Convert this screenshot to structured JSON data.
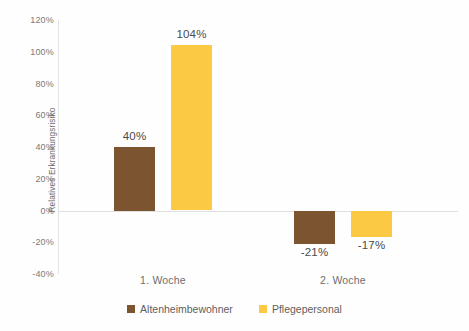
{
  "chart_data": {
    "type": "bar",
    "title": "",
    "xlabel": "",
    "ylabel": "Relatives Erkrankungsrisiko",
    "categories": [
      "1. Woche",
      "2. Woche"
    ],
    "series": [
      {
        "name": "Altenheimbewohner",
        "color": "#7d5430",
        "values": [
          40,
          -21
        ],
        "value_labels": [
          "40%",
          "-21%"
        ]
      },
      {
        "name": "Pflegepersonal",
        "color": "#fbc944",
        "values": [
          104,
          -17
        ],
        "value_labels": [
          "104%",
          "-17%"
        ]
      }
    ],
    "ylim": [
      -40,
      120
    ],
    "ytick_values": [
      120,
      100,
      80,
      60,
      40,
      20,
      0,
      -20,
      -40
    ],
    "ytick_labels": [
      "120%",
      "100%",
      "80%",
      "60%",
      "40%",
      "20%",
      "0%",
      "-20%",
      "-40%"
    ],
    "grid": false,
    "legend_position": "bottom"
  },
  "legend": {
    "entries": [
      {
        "label": "Altenheimbewohner"
      },
      {
        "label": "Pflegepersonal"
      }
    ]
  }
}
